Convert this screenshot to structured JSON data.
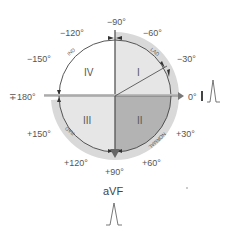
{
  "diagram": {
    "angle_labels": {
      "m90": "−90°",
      "m60": "−60°",
      "m30": "−30°",
      "zero": "0°",
      "p30": "+30°",
      "p60": "+60°",
      "p90": "+90°",
      "p120": "+120°",
      "p150": "+150°",
      "pm180": "∓180°",
      "m150": "−150°",
      "m120": "−120°"
    },
    "quadrants": {
      "q1": "I",
      "q2": "II",
      "q3": "III",
      "q4": "IV"
    },
    "arc_labels": {
      "lad": "LAD",
      "normal": "NORMAL",
      "rad": "RAD",
      "ind": "IND"
    },
    "leads": {
      "lead_i_marker": "I",
      "avf": "aVF"
    },
    "colors": {
      "outer_ring": "#d6d6d6",
      "quadrant_i": "#e3e3e3",
      "quadrant_ii": "#b0b0b0",
      "quadrant_iii": "#e3e3e3",
      "quadrant_iv": "#ffffff",
      "axis_line": "#555555"
    }
  }
}
